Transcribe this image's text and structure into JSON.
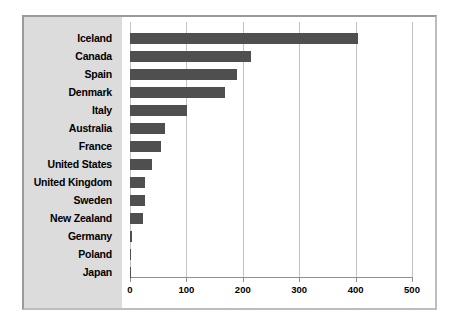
{
  "chart_data": {
    "type": "bar",
    "orientation": "horizontal",
    "title": "",
    "xlabel": "",
    "ylabel": "",
    "xlim": [
      0,
      500
    ],
    "xticks": [
      0,
      100,
      200,
      300,
      400,
      500
    ],
    "grid": true,
    "legend": null,
    "bar_color": "#4f4f4f",
    "panel_color": "#dcdcdc",
    "categories": [
      "Iceland",
      "Canada",
      "Spain",
      "Denmark",
      "Italy",
      "Australia",
      "France",
      "United States",
      "United Kingdom",
      "Sweden",
      "New Zealand",
      "Germany",
      "Poland",
      "Japan"
    ],
    "values": [
      404,
      215,
      190,
      168,
      101,
      62,
      55,
      39,
      27,
      27,
      23,
      4,
      1,
      1
    ]
  }
}
